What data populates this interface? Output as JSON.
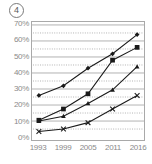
{
  "figure": {
    "number_label": "4",
    "number_marker": "circled-4"
  },
  "chart_data": {
    "type": "line",
    "title": "",
    "subtitle": "",
    "xlabel": "",
    "ylabel": "",
    "categories": [
      "1993",
      "1999",
      "2005",
      "2011",
      "2016"
    ],
    "x_tick_labels": [
      "1993",
      "1999",
      "2005",
      "2011",
      "2016"
    ],
    "y_tick_labels": [
      "0%",
      "10%",
      "20%",
      "30%",
      "40%",
      "50%",
      "60%",
      "70%"
    ],
    "y_tick_values": [
      0,
      10,
      20,
      30,
      40,
      50,
      60,
      70
    ],
    "ylim": [
      0,
      70
    ],
    "xlim_categories": 5,
    "grid": {
      "major_horizontal": true,
      "major_step": 10,
      "minor_horizontal_dotted": true,
      "minor_step": 5,
      "vertical": false
    },
    "legend": {
      "visible": false,
      "position": "none"
    },
    "series": [
      {
        "name": "series-1",
        "marker": "diamond",
        "color": "#1a1a1a",
        "values": [
          26,
          32,
          43,
          52,
          64
        ]
      },
      {
        "name": "series-2",
        "marker": "square",
        "color": "#1a1a1a",
        "values": [
          10.5,
          17.5,
          27,
          48,
          56
        ]
      },
      {
        "name": "series-3",
        "marker": "triangle",
        "color": "#1a1a1a",
        "values": [
          10,
          13,
          21,
          29.5,
          44
        ]
      },
      {
        "name": "series-4",
        "marker": "cross-x",
        "color": "#1a1a1a",
        "values": [
          3.5,
          5,
          9,
          17.5,
          26
        ]
      }
    ],
    "colors": {
      "axis": "#a9a9a9",
      "gridline_major": "#9e9e9e",
      "gridline_minor": "#9e9e9e",
      "tick_text": "#8a8a8a",
      "series_line": "#1a1a1a"
    }
  }
}
